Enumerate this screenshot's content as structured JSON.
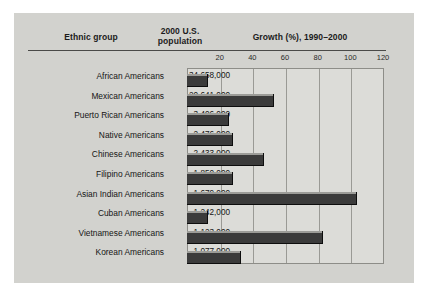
{
  "figure": {
    "headers": {
      "group": "Ethnic group",
      "population_line1": "2000 U.S.",
      "population_line2": "population",
      "growth": "Growth (%), 1990–2000"
    },
    "colors": {
      "background": "#d2d2ce",
      "plot_background": "#dcdcd8",
      "bar": "#3b3b3b",
      "gridline": "#9a9a95",
      "text": "#151515"
    }
  },
  "chart_data": {
    "type": "bar",
    "orientation": "horizontal",
    "title": "Growth (%), 1990–2000",
    "xlabel": "Growth (%), 1990–2000",
    "ylabel": "Ethnic group",
    "xlim": [
      0,
      120
    ],
    "ticks": [
      20,
      40,
      60,
      80,
      100,
      120
    ],
    "grid": true,
    "legend": "none",
    "categories": [
      "African Americans",
      "Mexican Americans",
      "Puerto Rican Americans",
      "Native Americans",
      "Chinese Americans",
      "Filipino Americans",
      "Asian Indian Americans",
      "Cuban Americans",
      "Vietnamese Americans",
      "Korean Americans"
    ],
    "values": [
      13,
      53,
      26,
      28,
      47,
      28,
      104,
      13,
      83,
      33
    ],
    "population_labels": [
      "34,658,000",
      "20,641,000",
      "3,406,000",
      "2,476,000",
      "2,433,000",
      "1,850,000",
      "1,679,000",
      "1,242,000",
      "1,123,000",
      "1,077,000"
    ],
    "population_values": [
      34658000,
      20641000,
      3406000,
      2476000,
      2433000,
      1850000,
      1679000,
      1242000,
      1123000,
      1077000
    ]
  }
}
